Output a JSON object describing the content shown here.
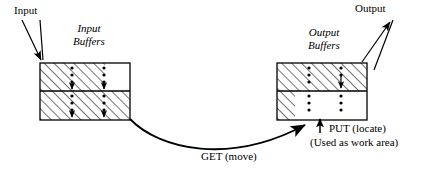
{
  "diagram": {
    "type": "buffer-flow-diagram",
    "labels": {
      "input": "Input",
      "output": "Output",
      "input_buffers": "Input\nBuffers",
      "input_buffers_line1": "Input",
      "input_buffers_line2": "Buffers",
      "output_buffers_line1": "Output",
      "output_buffers_line2": "Buffers",
      "get": "GET (move)",
      "put": "PUT (locate)",
      "work_area": "(Used as work area)"
    },
    "colors": {
      "stroke": "#000000",
      "background": "#ffffff",
      "hatch": "#000000"
    },
    "boxes": {
      "input_buffers": {
        "x": 40,
        "y": 63,
        "width": 90,
        "height": 57,
        "rows": 2,
        "cells": [
          {
            "row": 0,
            "col": 0,
            "hatched": true
          },
          {
            "row": 0,
            "col": 1,
            "hatched": false
          },
          {
            "row": 1,
            "col": 0,
            "hatched": true
          },
          {
            "row": 1,
            "col": 1,
            "hatched": true
          }
        ],
        "dot_columns": 2
      },
      "output_buffers": {
        "x": 277,
        "y": 63,
        "width": 90,
        "height": 57,
        "rows": 2,
        "cells": [
          {
            "row": 0,
            "col": 0,
            "hatched": true
          },
          {
            "row": 0,
            "col": 1,
            "hatched": true
          },
          {
            "row": 1,
            "col": 0,
            "hatched": true
          },
          {
            "row": 1,
            "col": 1,
            "hatched": false
          }
        ],
        "dot_columns": 2
      }
    },
    "connectors": [
      {
        "name": "input-arrow",
        "from": "Input",
        "to": "input-buffers-top-left",
        "style": "double-line-arrow"
      },
      {
        "name": "get-curve",
        "from": "input-buffers-bottom-right",
        "to": "output-buffers-bottom",
        "style": "curve-arrow",
        "label": "GET (move)"
      },
      {
        "name": "put-arrow",
        "from": "below",
        "to": "output-buffers-bottom",
        "style": "straight-arrow",
        "label": "PUT (locate)"
      },
      {
        "name": "output-arrow",
        "from": "output-buffers-top-right",
        "to": "Output",
        "style": "double-line-arrow"
      }
    ]
  }
}
